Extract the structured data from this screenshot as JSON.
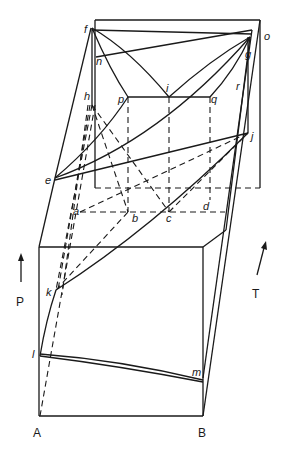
{
  "diagram": {
    "type": "ternary-style 3D phase diagram (P–T–composition prism)",
    "axes": {
      "pressure_label": "P",
      "temperature_label": "T",
      "component_a": "A",
      "component_b": "B"
    },
    "points": {
      "a": "a",
      "b": "b",
      "c": "c",
      "d": "d",
      "e": "e",
      "f": "f",
      "g": "g",
      "h": "h",
      "i": "i",
      "j": "j",
      "k": "k",
      "l": "l",
      "m": "m",
      "n": "n",
      "o": "o",
      "p": "p",
      "q": "q",
      "r": "r"
    },
    "colors": {
      "line": "#1a1a1a",
      "background": "#ffffff"
    }
  }
}
